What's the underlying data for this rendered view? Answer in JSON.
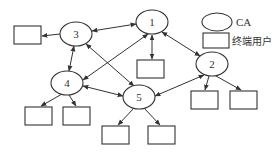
{
  "diagram": {
    "type": "network",
    "nodes": [
      {
        "id": "1",
        "label": "1",
        "kind": "CA"
      },
      {
        "id": "2",
        "label": "2",
        "kind": "CA"
      },
      {
        "id": "3",
        "label": "3",
        "kind": "CA"
      },
      {
        "id": "4",
        "label": "4",
        "kind": "CA"
      },
      {
        "id": "5",
        "label": "5",
        "kind": "CA"
      }
    ],
    "end_users": [
      {
        "id": "u3a",
        "attached_to": "3"
      },
      {
        "id": "u1a",
        "attached_to": "1"
      },
      {
        "id": "u4a",
        "attached_to": "4"
      },
      {
        "id": "u4b",
        "attached_to": "4"
      },
      {
        "id": "u5a",
        "attached_to": "5"
      },
      {
        "id": "u5b",
        "attached_to": "5"
      },
      {
        "id": "u2a",
        "attached_to": "2"
      },
      {
        "id": "u2b",
        "attached_to": "2"
      }
    ],
    "edges": [
      {
        "from": "1",
        "to": "3",
        "direction": "both"
      },
      {
        "from": "1",
        "to": "2",
        "direction": "both"
      },
      {
        "from": "1",
        "to": "4",
        "direction": "both"
      },
      {
        "from": "1",
        "to": "u1a",
        "direction": "both"
      },
      {
        "from": "3",
        "to": "4",
        "direction": "both"
      },
      {
        "from": "3",
        "to": "5",
        "direction": "both"
      },
      {
        "from": "3",
        "to": "u3a",
        "direction": "forward"
      },
      {
        "from": "4",
        "to": "5",
        "direction": "both"
      },
      {
        "from": "4",
        "to": "u4a",
        "direction": "forward"
      },
      {
        "from": "4",
        "to": "u4b",
        "direction": "forward"
      },
      {
        "from": "2",
        "to": "5",
        "direction": "both"
      },
      {
        "from": "2",
        "to": "u2a",
        "direction": "forward"
      },
      {
        "from": "2",
        "to": "u2b",
        "direction": "forward"
      },
      {
        "from": "5",
        "to": "u5a",
        "direction": "forward"
      },
      {
        "from": "5",
        "to": "u5b",
        "direction": "forward"
      }
    ]
  },
  "legend": {
    "ca_label": "CA",
    "end_user_label": "终端用户"
  }
}
